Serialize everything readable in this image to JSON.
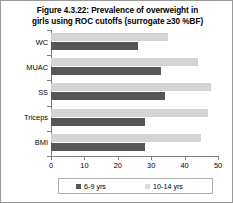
{
  "figure": {
    "title": "Figure 4.3.22: Prevalence of overweight in girls using ROC cutoffs (surrogate ≥30 %BF)",
    "title_line1": "Figure 4.3.22: Prevalence of overweight in",
    "title_line2": "girls using ROC cutoffs (surrogate ≥30 %BF)",
    "border_color": "#9a9a9a"
  },
  "legend": {
    "position": "bottom",
    "items": [
      {
        "label": "6-9 yrs",
        "color": "#565656"
      },
      {
        "label": "10-14 yrs",
        "color": "#d9d9d9"
      }
    ]
  },
  "chart_data": {
    "type": "bar",
    "orientation": "horizontal",
    "title": "Figure 4.3.22: Prevalence of overweight in girls using ROC cutoffs (surrogate ≥30 %BF)",
    "xlabel": "",
    "ylabel": "",
    "categories": [
      "WC",
      "MUAC",
      "SS",
      "Triceps",
      "BMI"
    ],
    "series": [
      {
        "name": "6-9 yrs",
        "color": "#565656",
        "values": [
          26,
          33,
          34,
          28,
          28
        ]
      },
      {
        "name": "10-14 yrs",
        "color": "#d4d4d4",
        "values": [
          35,
          44,
          48,
          47,
          45
        ]
      }
    ],
    "xlim": [
      0,
      50
    ],
    "xticks": [
      0,
      10,
      20,
      30,
      40,
      50
    ],
    "xtick_labels": [
      "0",
      "10",
      "20",
      "30",
      "40",
      "50"
    ],
    "grid": false,
    "legend_position": "bottom"
  }
}
